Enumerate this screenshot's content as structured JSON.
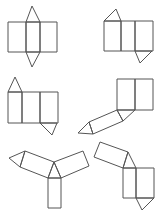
{
  "figure": {
    "title": "",
    "stroke_color": "#555555",
    "background": "#ffffff",
    "nets": [
      {
        "id": "net-1",
        "polygons": [
          [
            [
              8,
              22
            ],
            [
              26,
              22
            ],
            [
              26,
              52
            ],
            [
              8,
              52
            ]
          ],
          [
            [
              26,
              22
            ],
            [
              40,
              22
            ],
            [
              40,
              52
            ],
            [
              26,
              52
            ]
          ],
          [
            [
              40,
              22
            ],
            [
              57,
              22
            ],
            [
              57,
              52
            ],
            [
              40,
              52
            ]
          ],
          [
            [
              26,
              22
            ],
            [
              32,
              6
            ],
            [
              40,
              22
            ]
          ],
          [
            [
              26,
              52
            ],
            [
              32,
              67
            ],
            [
              40,
              52
            ]
          ]
        ]
      },
      {
        "id": "net-2",
        "polygons": [
          [
            [
              104,
              21
            ],
            [
              121,
              21
            ],
            [
              121,
              51
            ],
            [
              104,
              51
            ]
          ],
          [
            [
              121,
              21
            ],
            [
              135,
              21
            ],
            [
              135,
              51
            ],
            [
              121,
              51
            ]
          ],
          [
            [
              135,
              21
            ],
            [
              153,
              21
            ],
            [
              153,
              51
            ],
            [
              135,
              51
            ]
          ],
          [
            [
              104,
              21
            ],
            [
              116,
              9
            ],
            [
              121,
              21
            ]
          ],
          [
            [
              135,
              51
            ],
            [
              140,
              63
            ],
            [
              152,
              51
            ]
          ]
        ]
      },
      {
        "id": "net-3",
        "polygons": [
          [
            [
              8,
              92
            ],
            [
              22,
              92
            ],
            [
              22,
              123
            ],
            [
              8,
              123
            ]
          ],
          [
            [
              22,
              92
            ],
            [
              40,
              92
            ],
            [
              40,
              123
            ],
            [
              22,
              123
            ]
          ],
          [
            [
              40,
              92
            ],
            [
              58,
              92
            ],
            [
              58,
              123
            ],
            [
              40,
              123
            ]
          ],
          [
            [
              8,
              92
            ],
            [
              15,
              77
            ],
            [
              22,
              92
            ]
          ],
          [
            [
              40,
              123
            ],
            [
              52,
              135
            ],
            [
              57,
              123
            ]
          ]
        ]
      },
      {
        "id": "net-4",
        "polygons": [
          [
            [
              117,
              79
            ],
            [
              135,
              79
            ],
            [
              135,
              110
            ],
            [
              117,
              110
            ]
          ],
          [
            [
              135,
              79
            ],
            [
              153,
              79
            ],
            [
              153,
              110
            ],
            [
              135,
              110
            ]
          ],
          [
            [
              117,
              110
            ],
            [
              123,
              121
            ],
            [
              135,
              110
            ]
          ],
          [
            [
              117,
              110
            ],
            [
              123,
              121
            ],
            [
              93,
              134
            ],
            [
              89,
              122
            ]
          ],
          [
            [
              89,
              122
            ],
            [
              93,
              134
            ],
            [
              78,
              133
            ]
          ]
        ]
      },
      {
        "id": "net-5",
        "polygons": [
          [
            [
              48,
              178
            ],
            [
              54,
              162
            ],
            [
              61,
              178
            ]
          ],
          [
            [
              48,
              178
            ],
            [
              61,
              178
            ],
            [
              61,
              208
            ],
            [
              48,
              208
            ]
          ],
          [
            [
              54,
              162
            ],
            [
              48,
              178
            ],
            [
              20,
              167
            ],
            [
              25,
              151
            ]
          ],
          [
            [
              25,
              151
            ],
            [
              20,
              167
            ],
            [
              9,
              158
            ]
          ],
          [
            [
              54,
              162
            ],
            [
              61,
              178
            ],
            [
              89,
              166
            ],
            [
              83,
              151
            ]
          ]
        ]
      },
      {
        "id": "net-6",
        "polygons": [
          [
            [
              123,
              168
            ],
            [
              136,
              168
            ],
            [
              136,
              198
            ],
            [
              123,
              198
            ]
          ],
          [
            [
              136,
              168
            ],
            [
              154,
              168
            ],
            [
              154,
              198
            ],
            [
              136,
              198
            ]
          ],
          [
            [
              123,
              168
            ],
            [
              128,
              152
            ],
            [
              136,
              168
            ]
          ],
          [
            [
              136,
              198
            ],
            [
              142,
              210
            ],
            [
              154,
              198
            ]
          ],
          [
            [
              128,
              152
            ],
            [
              123,
              168
            ],
            [
              94,
              157
            ],
            [
              100,
              142
            ]
          ]
        ]
      }
    ]
  }
}
